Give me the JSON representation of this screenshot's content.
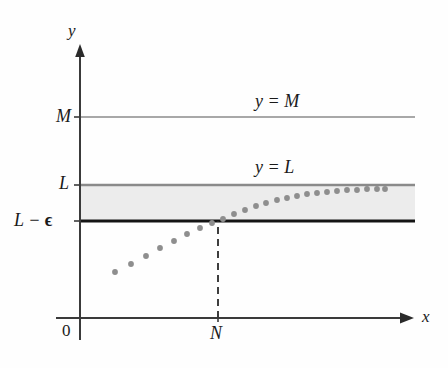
{
  "figure": {
    "kind": "limit-of-sequence-diagram",
    "axes": {
      "x_label": "x",
      "y_label": "y",
      "origin_label": "0"
    },
    "y_ticks": [
      {
        "name": "M-tick",
        "label": "M",
        "y_px": 117
      },
      {
        "name": "L-tick",
        "label": "L",
        "y_px": 185
      },
      {
        "name": "L-minus-epsilon-tick",
        "label_prefix": "L − ",
        "label_symbol": "ϵ",
        "label": "L − ϵ",
        "y_px": 221
      }
    ],
    "x_ticks": [
      {
        "name": "N-tick",
        "label": "N",
        "x_px": 218
      }
    ],
    "lines": [
      {
        "name": "y-equals-M-line",
        "label": "y = M",
        "y_px": 117,
        "color": "#a8a8a8",
        "width": 2.2
      },
      {
        "name": "y-equals-L-line",
        "label": "y = L",
        "y_px": 185,
        "color": "#8a8a8a",
        "width": 2.4
      },
      {
        "name": "y-equals-L-minus-epsilon-line",
        "label": "",
        "y_px": 221,
        "color": "#141414",
        "width": 3.0
      }
    ],
    "band": {
      "name": "epsilon-band",
      "top_px": 186,
      "bottom_px": 220,
      "fill": "#ececec"
    },
    "dashed_line": {
      "name": "N-dashed-line",
      "x_px": 218,
      "from_y_px": 318,
      "to_y_px": 221,
      "color": "#2a2a2a",
      "dash": "7,5"
    },
    "colors": {
      "axis": "#3a3a3a",
      "dot": "#8e8e8e",
      "band": "#ececec",
      "m_line": "#a8a8a8",
      "l_line": "#8a8a8a",
      "eps_line": "#141414",
      "background": "#fefefe"
    },
    "geometry": {
      "y_axis_x_px": 80,
      "x_axis_y_px": 318,
      "plot_right_px": 415,
      "y_axis_top_px": 48,
      "x_axis_right_px": 412
    }
  },
  "chart_data": {
    "type": "scatter",
    "title": "",
    "xlabel": "x",
    "ylabel": "y",
    "grid": false,
    "legend": "none",
    "annotations": [
      "y = M",
      "y = L",
      "M",
      "L",
      "L − ϵ",
      "N",
      "0",
      "x",
      "y"
    ],
    "series": [
      {
        "name": "sequence-terms",
        "marker": "dot",
        "color": "#8e8e8e",
        "points_px": [
          [
            115,
            272
          ],
          [
            131,
            264
          ],
          [
            146,
            256
          ],
          [
            160,
            248
          ],
          [
            174,
            241
          ],
          [
            187,
            234
          ],
          [
            200,
            228
          ],
          [
            212,
            223
          ],
          [
            223,
            219
          ],
          [
            234,
            214
          ],
          [
            245,
            210
          ],
          [
            256,
            206
          ],
          [
            266,
            203
          ],
          [
            277,
            200
          ],
          [
            287,
            198
          ],
          [
            297,
            196
          ],
          [
            307,
            194
          ],
          [
            317,
            193
          ],
          [
            327,
            192
          ],
          [
            337,
            191
          ],
          [
            347,
            190
          ],
          [
            357,
            190
          ],
          [
            367,
            189
          ],
          [
            377,
            189
          ],
          [
            385,
            189
          ]
        ]
      }
    ],
    "reference_lines": [
      {
        "label": "y = M",
        "y_px": 117
      },
      {
        "label": "y = L",
        "y_px": 185
      },
      {
        "label": "L − ϵ",
        "y_px": 221
      }
    ],
    "shaded_region": {
      "label": "epsilon-band",
      "top_px": 186,
      "bottom_px": 220
    },
    "vertical_marker": {
      "label": "N",
      "x_px": 218
    }
  },
  "labels": {
    "y_axis": "y",
    "x_axis": "x",
    "origin": "0",
    "m_tick": "M",
    "l_tick": "L",
    "eps_tick_prefix": "L − ",
    "eps_tick_symbol": "ϵ",
    "n_tick": "N",
    "y_eq_m": "y = M",
    "y_eq_l": "y = L"
  }
}
